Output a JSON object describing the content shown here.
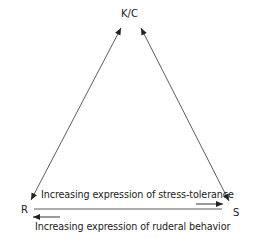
{
  "diagram": {
    "vertices": {
      "top": "K/C",
      "left": "R",
      "right": "S"
    },
    "captions": {
      "upper": "Increasing expression of stress-tolerance",
      "lower": "Increasing expression of ruderal behavior"
    },
    "edges": [
      {
        "from": "R",
        "to": "K/C",
        "arrows": "both"
      },
      {
        "from": "S",
        "to": "K/C",
        "arrows": "both"
      },
      {
        "from": "R",
        "to": "S",
        "arrows": "none",
        "note": "baseline"
      },
      {
        "direction": "right",
        "toward": "S",
        "meaning": "stress-tolerance"
      },
      {
        "direction": "left",
        "toward": "R",
        "meaning": "ruderal behavior"
      }
    ],
    "colors": {
      "line": "#333333",
      "text": "#222222",
      "background": "#ffffff"
    }
  }
}
